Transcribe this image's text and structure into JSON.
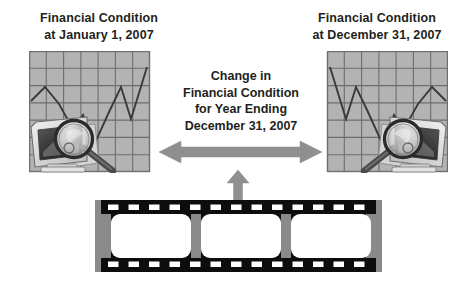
{
  "page": {
    "background_color": "#ffffff",
    "width": 474,
    "height": 292
  },
  "left_panel": {
    "name": "financial-condition-beginning",
    "title_line1": "Financial Condition",
    "title_line2": "at January 1, 2007",
    "illustration": {
      "name": "grid-chart-monitor-magnifier",
      "grid_columns": 7,
      "grid_rows": 7,
      "grid_fill": "#b3b3b3",
      "grid_line_color": "#6e6e6e",
      "line_color": "#3a3a3a",
      "elements": [
        "line-chart",
        "crt-monitor",
        "magnifying-glass",
        "document"
      ]
    }
  },
  "center": {
    "name": "change-caption",
    "line1": "Change in",
    "line2": "Financial Condition",
    "line3": "for Year Ending",
    "line4": "December 31, 2007",
    "double_arrow": {
      "name": "horizontal-double-arrow",
      "color": "#8f8f8f",
      "direction": "both"
    },
    "up_arrow": {
      "name": "upward-arrow",
      "color": "#8f8f8f",
      "direction": "up"
    }
  },
  "right_panel": {
    "name": "financial-condition-ending",
    "title_line1": "Financial Condition",
    "title_line2": "at December 31, 2007",
    "illustration": {
      "name": "grid-chart-monitor-magnifier-mirrored",
      "grid_columns": 7,
      "grid_rows": 7,
      "grid_fill": "#b3b3b3",
      "grid_line_color": "#6e6e6e",
      "line_color": "#3a3a3a",
      "elements": [
        "line-chart",
        "crt-monitor",
        "magnifying-glass",
        "document"
      ]
    }
  },
  "filmstrip": {
    "name": "film-strip",
    "frame_count": 3,
    "sprocket_count_per_row": 13,
    "body_color": "#0d0d0d",
    "edge_color": "#8a8a8a",
    "frame_color": "#ffffff",
    "sprocket_color": "#ffffff"
  },
  "colors": {
    "text": "#231f20",
    "arrow_gray": "#8f8f8f",
    "grid_gray": "#b3b3b3",
    "film_black": "#0d0d0d",
    "film_edge": "#8a8a8a"
  }
}
